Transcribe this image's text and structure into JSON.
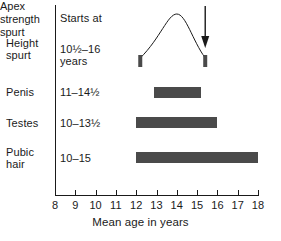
{
  "chart_data": {
    "type": "bar",
    "title": "",
    "xlabel": "Mean age in years",
    "ylabel": "",
    "xlim": [
      8,
      18
    ],
    "xticks": [
      8,
      9,
      10,
      11,
      12,
      13,
      14,
      15,
      16,
      17,
      18
    ],
    "grid": false,
    "orientation": "horizontal",
    "column_header": "Starts at",
    "categories": [
      "Height spurt",
      "Penis",
      "Testes",
      "Pubic hair"
    ],
    "bars": [
      {
        "category": "Height spurt",
        "label_line1": "Height",
        "label_line2": "spurt",
        "starts_at": "10½–16",
        "starts_at_line2": "years",
        "start": 12.2,
        "end": 15.4,
        "style": "velocity-curve",
        "peak_age": 14.0,
        "annotation": "Apex strength spurt"
      },
      {
        "category": "Penis",
        "label_line1": "Penis",
        "label_line2": "",
        "starts_at": "11–14½",
        "starts_at_line2": "",
        "start": 12.9,
        "end": 15.2,
        "style": "solid-bar"
      },
      {
        "category": "Testes",
        "label_line1": "Testes",
        "label_line2": "",
        "starts_at": "10–13½",
        "starts_at_line2": "",
        "start": 12.0,
        "end": 16.0,
        "style": "solid-bar"
      },
      {
        "category": "Pubic hair",
        "label_line1": "Pubic",
        "label_line2": "hair",
        "starts_at": "10–15",
        "starts_at_line2": "",
        "start": 12.0,
        "end": 18.0,
        "style": "solid-bar"
      }
    ],
    "annotations": [
      {
        "name": "apex-strength-spurt",
        "line1": "Apex",
        "line2": "strength",
        "line3": "spurt",
        "points_to_age": 15.4,
        "arrow": "down"
      }
    ],
    "colors": {
      "bar": "#4a4a4a",
      "axis": "#1a1a1a",
      "text": "#1a1a1a",
      "background": "#ffffff"
    }
  },
  "axis": {
    "tick_labels": [
      "8",
      "9",
      "10",
      "11",
      "12",
      "13",
      "14",
      "15",
      "16",
      "17",
      "18"
    ],
    "title": "Mean age in years"
  },
  "header": {
    "column_label": "Starts at"
  },
  "rows": [
    {
      "name_line1": "Height",
      "name_line2": "spurt",
      "value_line1": "10½–16",
      "value_line2": "years"
    },
    {
      "name_line1": "Penis",
      "name_line2": "",
      "value_line1": "11–14½",
      "value_line2": ""
    },
    {
      "name_line1": "Testes",
      "name_line2": "",
      "value_line1": "10–13½",
      "value_line2": ""
    },
    {
      "name_line1": "Pubic",
      "name_line2": "hair",
      "value_line1": "10–15",
      "value_line2": ""
    }
  ],
  "annotation": {
    "line1": "Apex",
    "line2": "strength",
    "line3": "spurt"
  }
}
